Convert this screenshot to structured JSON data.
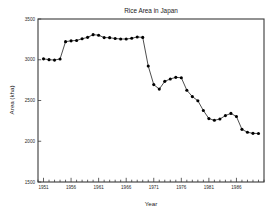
{
  "chart_data": {
    "type": "line",
    "title": "Rice Area in Japan",
    "xlabel": "Year",
    "ylabel": "Area (kha)",
    "xlim": [
      1950,
      1991
    ],
    "ylim": [
      1500,
      3500
    ],
    "yticks": [
      1500,
      2000,
      2500,
      3000,
      3500
    ],
    "ytick_labels": [
      "1500",
      "2000",
      "2500",
      "3000",
      "3500"
    ],
    "xticks": [
      1951,
      1956,
      1961,
      1966,
      1971,
      1976,
      1981,
      1986
    ],
    "xtick_labels": [
      "1951",
      "1956",
      "1961",
      "1966",
      "1971",
      "1976",
      "1981",
      "1986"
    ],
    "minor_xtick_step": 1,
    "grid": false,
    "legend": null,
    "marker": "filled-circle",
    "line_color": "#111111",
    "marker_color": "#000000",
    "frame_color": "#3a3a3a",
    "background": "#ffffff",
    "x": [
      1951,
      1952,
      1953,
      1954,
      1955,
      1956,
      1957,
      1958,
      1959,
      1960,
      1961,
      1962,
      1963,
      1964,
      1965,
      1966,
      1967,
      1968,
      1969,
      1970,
      1971,
      1972,
      1973,
      1974,
      1975,
      1976,
      1977,
      1978,
      1979,
      1980,
      1981,
      1982,
      1983,
      1984,
      1985,
      1986,
      1987,
      1988,
      1989,
      1990
    ],
    "values": [
      3011,
      3001,
      2996,
      3010,
      3222,
      3232,
      3237,
      3257,
      3275,
      3308,
      3301,
      3272,
      3271,
      3260,
      3255,
      3254,
      3263,
      3280,
      3274,
      2923,
      2695,
      2640,
      2735,
      2764,
      2784,
      2779,
      2626,
      2548,
      2497,
      2377,
      2278,
      2257,
      2273,
      2315,
      2342,
      2303,
      2146,
      2110,
      2097,
      2095
    ],
    "series_name": "Rice planted area"
  }
}
